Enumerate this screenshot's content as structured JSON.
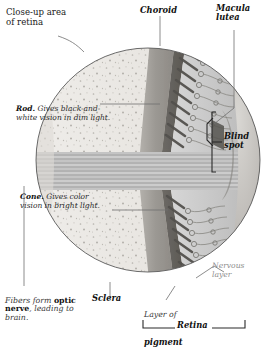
{
  "figure": {
    "style": "grayscale anatomical illustration"
  },
  "labels": {
    "closeup": "Close-up area\nof retina",
    "choroid": "Choroid",
    "macula": "Macula\nlutea",
    "blind_spot": "Blind\nspot",
    "nervous_layer": "Nervous\nlayer",
    "sclera": "Sclera",
    "retina_bracket": "Retina",
    "rod_bold": "Rod.",
    "rod_rest": " Gives black-and-\nwhite vision in dim light.",
    "cone_bold": "Cone.",
    "cone_rest": " Gives color\nvision in bright light.",
    "pigment_line1": "Layer of",
    "pigment_line2": "pigment",
    "fibers_a": "Fibers form ",
    "fibers_b": "optic",
    "fibers_c": "nerve",
    "fibers_d": ", leading to",
    "fibers_e": "brain."
  },
  "colors": {
    "background": "#ffffff",
    "sclera": "#e9e7e2",
    "sclera_speck": "#b5b2ac",
    "choroid": "#9a9792",
    "pigment": "#6e6b66",
    "nerve_band_light": "#c9c9c9",
    "nerve_band_dark": "#a9a9a9",
    "photoreceptor": "#5f5d59",
    "neuron_line": "#8a8a8a",
    "outline": "#4a4a4a",
    "leader": "#6e6e6e",
    "text_dark": "#111111",
    "text_gray": "#8d8d8d"
  }
}
